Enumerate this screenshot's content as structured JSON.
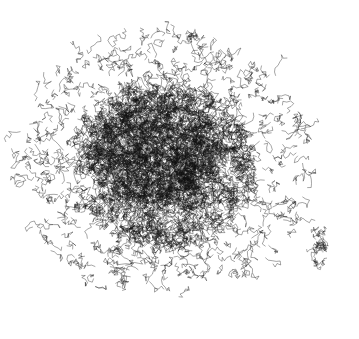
{
  "image": {
    "description": "Black wireframe rendering of a large molecular structure (protein) on white background",
    "background": "#ffffff",
    "ink": "#111111",
    "cluster_center": [
      165,
      165
    ],
    "cluster_radius": [
      150,
      135
    ],
    "fragments": [
      {
        "center": [
          320,
          240
        ],
        "radius": 12
      },
      {
        "center": [
          318,
          265
        ],
        "radius": 4
      }
    ]
  }
}
